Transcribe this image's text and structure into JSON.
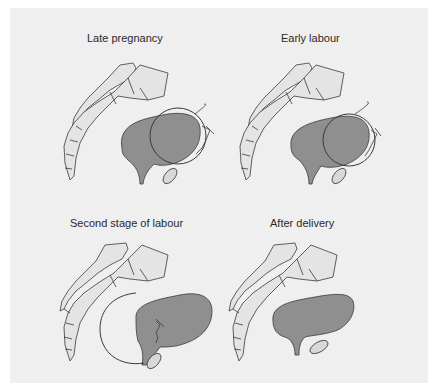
{
  "figure": {
    "panels": [
      {
        "id": "late-pregnancy",
        "title": "Late pregnancy",
        "stage": 0
      },
      {
        "id": "early-labour",
        "title": "Early labour",
        "stage": 1
      },
      {
        "id": "second-stage-of-labour",
        "title": "Second stage of labour",
        "stage": 2
      },
      {
        "id": "after-delivery",
        "title": "After delivery",
        "stage": 3
      }
    ]
  },
  "colors": {
    "background": "#efefef",
    "organ_fill": "#8f8f8f",
    "bone_fill": "#e4e4e4",
    "stroke": "#3a3a3a"
  }
}
